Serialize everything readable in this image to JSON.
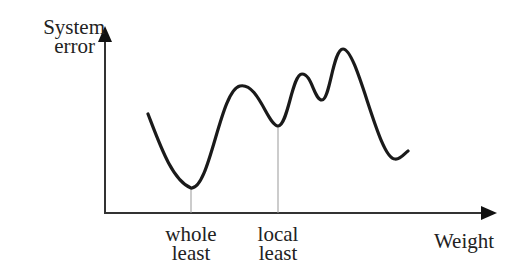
{
  "diagram": {
    "y_axis_label_line1": "System",
    "y_axis_label_line2": "error",
    "x_axis_label": "Weight",
    "markers": [
      {
        "line1": "whole",
        "line2": "least"
      },
      {
        "line1": "local",
        "line2": "least"
      }
    ],
    "colors": {
      "curve": "#1a1a1a",
      "axis": "#333333",
      "guide": "#999999"
    }
  }
}
